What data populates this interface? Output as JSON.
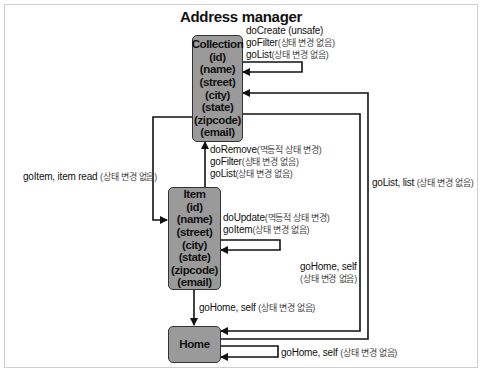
{
  "diagram": {
    "title": "Address manager",
    "nodes": {
      "collection": {
        "label": "Collection",
        "fields": [
          "(id)",
          "(name)",
          "(street)",
          "(city)",
          "(state)",
          "(zipcode)",
          "(email)"
        ]
      },
      "item": {
        "label": "Item",
        "fields": [
          "(id)",
          "(name)",
          "(street)",
          "(city)",
          "(state)",
          "(zipcode)",
          "(email)"
        ]
      },
      "home": {
        "label": "Home"
      }
    },
    "edges": {
      "collection_self": [
        {
          "action": "doCreate",
          "note": "(unsafe)"
        },
        {
          "action": "goFilter",
          "note": "(상태 변경 없음)"
        },
        {
          "action": "goList",
          "note": "(상태 변경 없음)"
        }
      ],
      "item_to_collection": [
        {
          "action": "doRemove",
          "note": "(멱등적 상태 변경)"
        },
        {
          "action": "goFilter",
          "note": "(상태 변경 없음)"
        },
        {
          "action": "goList",
          "note": "(상태 변경 없음)"
        }
      ],
      "collection_to_item": {
        "action": "goItem, item read",
        "note": "(상태 변경 없음)"
      },
      "item_self": [
        {
          "action": "doUpdate",
          "note": "(멱등적 상태 변경)"
        },
        {
          "action": "goItem",
          "note": "(상태 변경 없음)"
        }
      ],
      "item_to_home": {
        "action": "goHome, self",
        "note": "(상태 변경 없음)"
      },
      "collection_to_home": {
        "action": "goHome, self",
        "note": "(상태 변경 없음)"
      },
      "home_to_collection": {
        "action": "goList, list",
        "note": "(상태 변경 없음)"
      },
      "home_self": {
        "action": "goHome, self",
        "note": "(상태 변경 없음)"
      }
    },
    "colors": {
      "node_fill": "#9a9a9a",
      "line": "#111111",
      "frame": "#cfcfcf"
    }
  }
}
